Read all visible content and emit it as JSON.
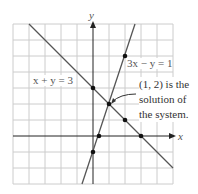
{
  "figure": {
    "axis_x_label": "x",
    "axis_y_label": "y",
    "line1": {
      "equation": "x + y = 3",
      "points": [
        [
          0,
          3
        ],
        [
          2,
          1
        ],
        [
          3,
          0
        ]
      ]
    },
    "line2": {
      "equation": "3x − y = 1",
      "points": [
        [
          0,
          -1
        ],
        [
          0.333,
          0
        ],
        [
          2,
          5
        ]
      ]
    },
    "intersection": [
      1,
      2
    ],
    "annotation": [
      "(1, 2) is the",
      "solution of",
      "the system."
    ],
    "grid": {
      "xmin": -5,
      "xmax": 5,
      "ymin": -3,
      "ymax": 7
    },
    "colors": {
      "line": "#555555",
      "grid": "#cccccc",
      "axis": "#222222",
      "dot": "#111111"
    }
  }
}
